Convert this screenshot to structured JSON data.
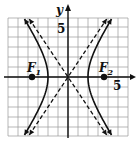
{
  "chart_data": {
    "type": "line",
    "title": "",
    "xlabel": "x",
    "ylabel": "y",
    "xlim": [
      -6,
      6
    ],
    "ylim": [
      -6,
      6
    ],
    "grid": true,
    "tick_labels": {
      "x": [
        "5"
      ],
      "y": [
        "5"
      ]
    },
    "equation": "x^2/4 - y^2/9 = 1",
    "series": [
      {
        "name": "hyperbola",
        "style": "solid",
        "a": 2,
        "b": 3,
        "vertices": [
          [
            -2,
            0
          ],
          [
            2,
            0
          ]
        ]
      },
      {
        "name": "asymptote_1",
        "style": "dashed",
        "slope": 1.5,
        "intercept": 0
      },
      {
        "name": "asymptote_2",
        "style": "dashed",
        "slope": -1.5,
        "intercept": 0
      }
    ],
    "points": [
      {
        "label": "F",
        "subscript": "1",
        "x": -3.6,
        "y": 0
      },
      {
        "label": "F",
        "subscript": "2",
        "x": 3.6,
        "y": 0
      }
    ]
  },
  "labels": {
    "y_axis": "y",
    "x_axis": "x",
    "y_tick": "5",
    "x_tick": "5",
    "focus1_main": "F",
    "focus1_sub": "1",
    "focus2_main": "F",
    "focus2_sub": "2"
  },
  "colors": {
    "ink": "#111111",
    "grid": "#9a9a9a",
    "background": "#ffffff"
  }
}
